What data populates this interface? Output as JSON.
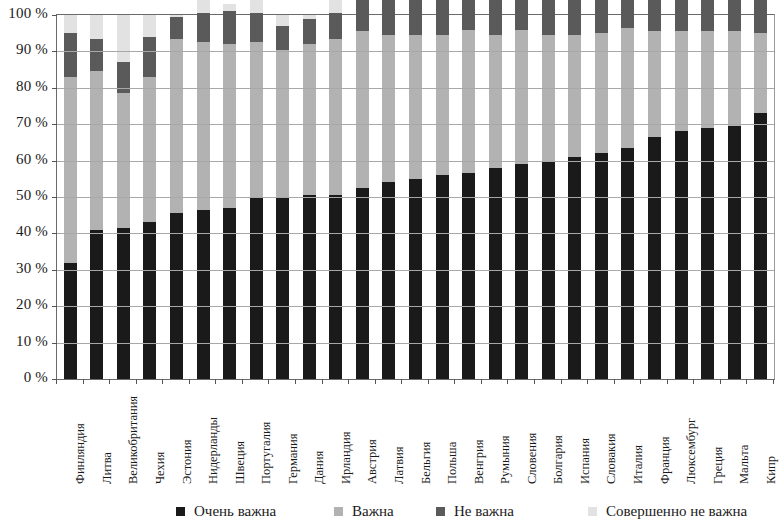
{
  "chart_data": {
    "type": "bar",
    "subtype": "stacked-bar-100",
    "title": "",
    "xlabel": "",
    "ylabel": "",
    "ylim": [
      0,
      100
    ],
    "grid": true,
    "legend_position": "bottom",
    "y_ticks": [
      "0 %",
      "10 %",
      "20 %",
      "30 %",
      "40 %",
      "50 %",
      "60 %",
      "70 %",
      "80 %",
      "90 %",
      "100 %"
    ],
    "y_tick_values": [
      0,
      10,
      20,
      30,
      40,
      50,
      60,
      70,
      80,
      90,
      100
    ],
    "categories": [
      "Финляндия",
      "Литва",
      "Великобритания",
      "Чехия",
      "Эстония",
      "Нидерланды",
      "Швеция",
      "Португалия",
      "Германия",
      "Дания",
      "Ирландия",
      "Австрия",
      "Латвия",
      "Бельгия",
      "Польша",
      "Венгрия",
      "Румыния",
      "Словения",
      "Болгария",
      "Испания",
      "Словакия",
      "Италия",
      "Франция",
      "Люксембург",
      "Греция",
      "Мальта",
      "Кипр"
    ],
    "series": [
      {
        "name": "Очень важна",
        "color": "#1a1a1a",
        "values": [
          32,
          41,
          41.5,
          43,
          45.5,
          46.5,
          47,
          50,
          50,
          50.5,
          50.5,
          52.5,
          54,
          55,
          56,
          56.5,
          58,
          59,
          60,
          61,
          62,
          63.5,
          66.5,
          68,
          69,
          69.5,
          73
        ]
      },
      {
        "name": "Важна",
        "color": "#b2b2b2",
        "values": [
          51,
          43.5,
          37,
          40,
          48,
          46,
          45,
          42.5,
          40.5,
          41.5,
          43,
          43,
          40.5,
          39.5,
          38.5,
          39.5,
          36.5,
          37,
          34.5,
          33.5,
          33,
          33,
          29,
          27.5,
          26.5,
          26,
          22
        ]
      },
      {
        "name": "Не важна",
        "color": "#5a5a5a",
        "values": [
          12,
          9,
          8.5,
          11,
          6,
          8,
          9,
          8,
          6.5,
          7,
          7,
          9.5,
          10,
          10,
          10.5,
          9.5,
          10,
          9.5,
          10,
          9.5,
          10,
          8,
          9.5,
          8.5,
          9,
          9.5,
          10
        ]
      },
      {
        "name": "Совершенно не важна",
        "color": "#e2e2e2",
        "values": [
          5,
          6.5,
          13,
          6,
          0.5,
          3.5,
          2,
          4.5,
          3,
          1,
          4.5,
          4.5,
          5,
          4.5,
          5,
          2,
          2.5,
          3.5,
          4.5,
          5,
          4,
          3.5,
          4,
          4,
          4.5,
          4.5,
          5
        ]
      }
    ]
  },
  "legend": {
    "items": [
      {
        "label": "Очень важна",
        "color": "#1a1a1a"
      },
      {
        "label": "Важна",
        "color": "#b2b2b2"
      },
      {
        "label": "Не важна",
        "color": "#5a5a5a"
      },
      {
        "label": "Совершенно не важна",
        "color": "#e2e2e2"
      }
    ]
  }
}
